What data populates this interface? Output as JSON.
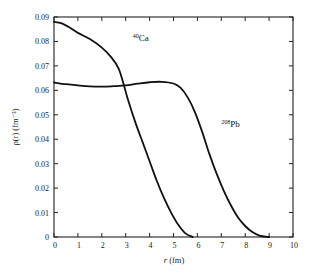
{
  "chart_data": {
    "type": "line",
    "title": "",
    "xlabel": "r (fm)",
    "ylabel": "ρ(r) (fm⁻³)",
    "xlim": [
      0,
      10
    ],
    "ylim": [
      0,
      0.09
    ],
    "grid": false,
    "x_ticks": [
      "0",
      "1",
      "2",
      "3",
      "4",
      "5",
      "6",
      "7",
      "8",
      "9",
      "10"
    ],
    "y_ticks": [
      "0",
      "0.01",
      "0.02",
      "0.03",
      "0.04",
      "0.05",
      "0.06",
      "0.07",
      "0.08",
      "0.09"
    ],
    "series": [
      {
        "name": "40Ca",
        "label_mass": "40",
        "label_symbol": "Ca",
        "x": [
          0,
          0.3,
          0.6,
          1.0,
          1.5,
          2.0,
          2.4,
          2.7,
          2.9,
          3.1,
          3.4,
          3.7,
          4.0,
          4.3,
          4.6,
          4.9,
          5.2,
          5.5,
          5.8
        ],
        "values": [
          0.088,
          0.0875,
          0.086,
          0.0835,
          0.081,
          0.0775,
          0.0735,
          0.069,
          0.063,
          0.056,
          0.047,
          0.039,
          0.031,
          0.023,
          0.016,
          0.01,
          0.005,
          0.0015,
          0.0
        ]
      },
      {
        "name": "208Pb",
        "label_mass": "208",
        "label_symbol": "Pb",
        "x": [
          0,
          0.5,
          1.0,
          1.5,
          2.0,
          2.5,
          3.0,
          3.5,
          4.0,
          4.5,
          5.0,
          5.3,
          5.6,
          5.9,
          6.2,
          6.5,
          6.8,
          7.1,
          7.4,
          7.7,
          8.0,
          8.3,
          8.6,
          9.0
        ],
        "values": [
          0.0632,
          0.0625,
          0.062,
          0.0616,
          0.0615,
          0.0617,
          0.062,
          0.0627,
          0.0633,
          0.0635,
          0.0628,
          0.061,
          0.057,
          0.051,
          0.043,
          0.034,
          0.026,
          0.019,
          0.013,
          0.008,
          0.0045,
          0.002,
          0.0006,
          0.0
        ]
      }
    ],
    "annotations": [
      {
        "text": "40Ca",
        "x": 3.3,
        "y": 0.08
      },
      {
        "text": "208Pb",
        "x": 7.0,
        "y": 0.045
      }
    ]
  }
}
